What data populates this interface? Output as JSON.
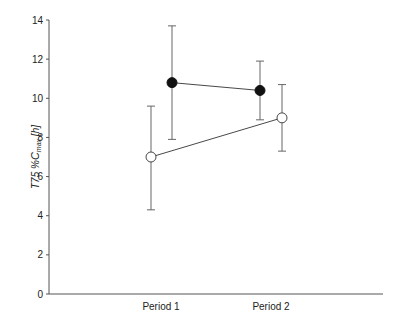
{
  "chart_data": {
    "type": "line",
    "title": "",
    "xlabel": "",
    "ylabel": "T75 %Cmax [h]",
    "ylabel_parts": {
      "pre": "T75 %",
      "main": "C",
      "sub": "max",
      "post": " [h]"
    },
    "ylim": [
      0,
      14
    ],
    "yticks": [
      0,
      2,
      4,
      6,
      8,
      10,
      12,
      14
    ],
    "categories": [
      "Period 1",
      "Period 2"
    ],
    "grid": false,
    "legend": null,
    "error_bars": true,
    "series": [
      {
        "name": "open-circle-group",
        "marker": "open-circle",
        "values": [
          7.0,
          9.0
        ],
        "err_upper": [
          9.6,
          10.7
        ],
        "err_lower": [
          4.3,
          7.3
        ],
        "x_offset": [
          -1,
          1
        ]
      },
      {
        "name": "filled-circle-group",
        "marker": "filled-circle",
        "values": [
          10.8,
          10.4
        ],
        "err_upper": [
          13.7,
          11.9
        ],
        "err_lower": [
          7.9,
          8.9
        ],
        "x_offset": [
          1,
          -1
        ]
      }
    ]
  },
  "colors": {
    "axis": "#555555",
    "line": "#333333",
    "marker_fill": "#111111",
    "errbar": "#666666"
  }
}
